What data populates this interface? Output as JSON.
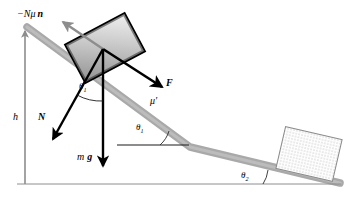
{
  "figure": {
    "background_color": "#ffffff",
    "width": 351,
    "height": 200,
    "colors": {
      "ink": "#000000",
      "ramp_gray": "#a9a9a9",
      "ramp_gray_light": "#bdbdbd",
      "block_fill_light": "#e8e8e8",
      "block_fill_dark": "#8f8f8f",
      "axis_gray": "#9a9a9a",
      "hatch_dot": "#6a6a6a"
    }
  },
  "labels": {
    "friction_vector": "−Nμ",
    "friction_vector_unit": "n",
    "height": "h",
    "normal_force": "N",
    "theta_symbol": "θ",
    "theta_one_sub": "1",
    "theta_two_sub": "2",
    "weight_mass": "m",
    "weight_g": "g",
    "applied_force": "F",
    "mu_prime": "μ′"
  },
  "elements": {
    "upper_block": {
      "name": "sliding-block",
      "fill": "gradient-gray",
      "tilt_degrees": -28
    },
    "lower_block": {
      "name": "dotted-block",
      "fill": "dotted-texture",
      "tilt_degrees": 13
    },
    "ramp": {
      "segments": [
        {
          "from_x": 27,
          "from_y": 27,
          "to_x": 190,
          "to_y": 147
        },
        {
          "from_x": 190,
          "from_y": 147,
          "to_x": 340,
          "to_y": 183
        }
      ]
    },
    "ground_line": {
      "from_x": 17,
      "from_y": 184,
      "to_x": 341,
      "to_y": 184
    },
    "reference_line": {
      "from_x": 117,
      "from_y": 145,
      "to_x": 190,
      "to_y": 145
    }
  },
  "vectors": [
    {
      "name": "friction-vector",
      "label": "−Nμ n",
      "direction": "up-left"
    },
    {
      "name": "normal-force-vector",
      "label": "N",
      "direction": "down-left"
    },
    {
      "name": "weight-vector",
      "label": "m g",
      "direction": "down"
    },
    {
      "name": "applied-force-vector",
      "label": "F",
      "direction": "down-right"
    },
    {
      "name": "height-vector",
      "label": "h",
      "direction": "up"
    }
  ],
  "angles": [
    {
      "name": "theta-1-at-block",
      "label": "θ₁"
    },
    {
      "name": "theta-1-at-incline",
      "label": "θ₁"
    },
    {
      "name": "theta-2-at-base",
      "label": "θ₂"
    }
  ]
}
